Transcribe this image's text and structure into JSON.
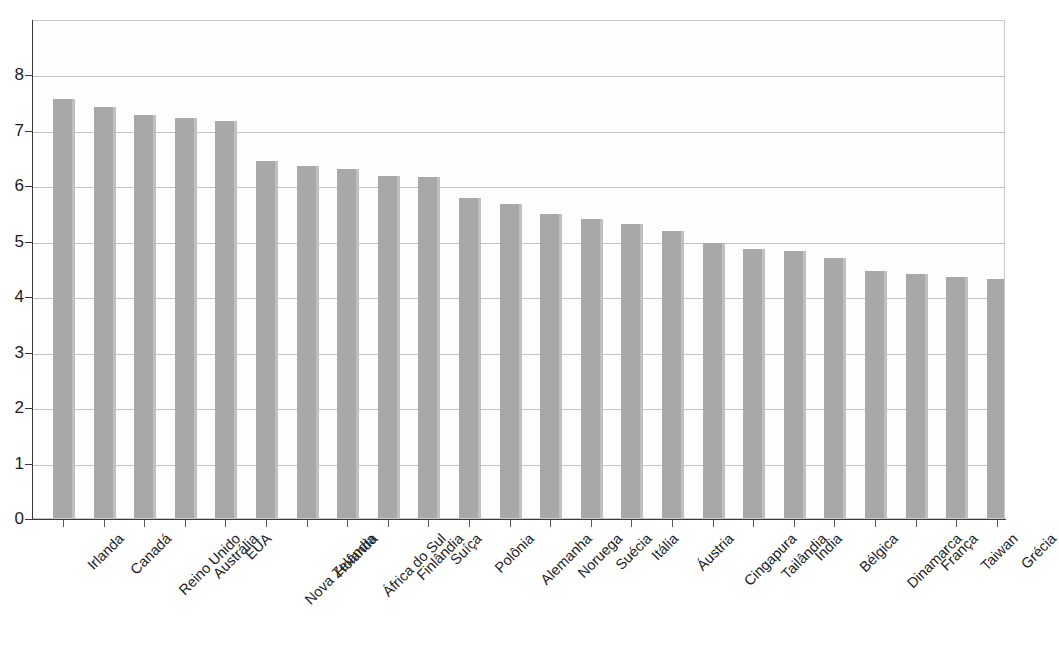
{
  "chart_data": {
    "type": "bar",
    "title": "",
    "subtitle": "",
    "xlabel": "",
    "ylabel": "",
    "ylim": [
      0,
      8
    ],
    "y_ticks": [
      0,
      1,
      2,
      3,
      4,
      5,
      6,
      7,
      8
    ],
    "y_tick_labels": [
      "0",
      "1",
      "2",
      "3",
      "4",
      "5",
      "6",
      "7",
      "8"
    ],
    "grid": true,
    "legend": null,
    "orientation": "vertical",
    "bar_color": "#a8a8a8",
    "categories": [
      "Irlanda",
      "Canadá",
      "Reino Unido",
      "Austrália",
      "EUA",
      "Nova Zelândia",
      "Holanda",
      "África do Sul",
      "Finlândia",
      "Suíça",
      "Polônia",
      "Alemanha",
      "Noruega",
      "Suécia",
      "Itália",
      "Áustria",
      "Cingapura",
      "Tailândia",
      "Índia",
      "Bélgica",
      "Dinamarca",
      "França",
      "Taiwan",
      "Grécia"
    ],
    "values": [
      7.55,
      7.4,
      7.26,
      7.21,
      7.15,
      6.43,
      6.34,
      6.29,
      6.17,
      6.14,
      5.77,
      5.65,
      5.47,
      5.38,
      5.29,
      5.18,
      4.96,
      4.85,
      4.81,
      4.69,
      4.45,
      4.4,
      4.34,
      4.3
    ]
  }
}
